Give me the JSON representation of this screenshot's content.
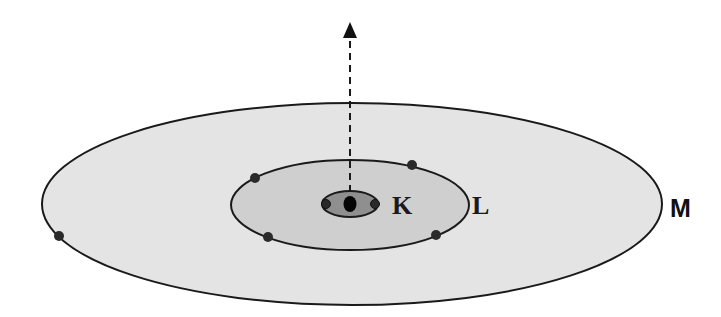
{
  "diagram": {
    "type": "atomic-shell-model",
    "colors": {
      "background": "#ffffff",
      "shell_m_fill": "#e4e4e4",
      "shell_l_fill": "#cfcfcf",
      "shell_k_fill": "#8f8f8f",
      "outline": "#1a1a1a",
      "electron": "#2a2a2a",
      "nucleus": "#050505"
    },
    "shells": [
      {
        "label": "K",
        "cx": 350,
        "cy": 204,
        "rx": 29,
        "ry": 13,
        "electrons": [
          [
            326,
            204
          ],
          [
            375,
            204
          ]
        ]
      },
      {
        "label": "L",
        "cx": 350,
        "cy": 205,
        "rx": 119,
        "ry": 45,
        "electrons": [
          [
            255,
            178
          ],
          [
            412,
            165
          ],
          [
            268,
            237
          ],
          [
            436,
            235
          ]
        ]
      },
      {
        "label": "M",
        "cx": 352,
        "cy": 204,
        "rx": 310,
        "ry": 101,
        "electrons": [
          [
            59,
            236
          ]
        ]
      }
    ],
    "labels": {
      "k": "K",
      "l": "L",
      "m": "M"
    },
    "nucleus": {
      "cx": 350,
      "cy": 204,
      "r": 7
    },
    "arrow": {
      "x": 350,
      "y_start": 190,
      "y_end": 22,
      "style": "dashed"
    }
  }
}
